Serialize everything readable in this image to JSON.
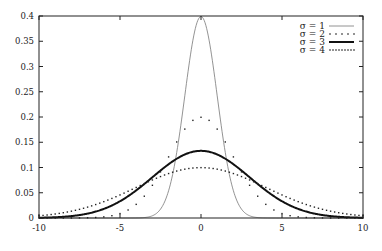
{
  "chart_data": {
    "type": "line",
    "title": "",
    "xlabel": "",
    "ylabel": "",
    "xlim": [
      -10,
      10
    ],
    "ylim": [
      0,
      0.4
    ],
    "x_ticks": [
      -10,
      -5,
      0,
      5,
      10
    ],
    "x_tick_labels": [
      "-10",
      "-5",
      "0",
      "5",
      "10"
    ],
    "y_ticks": [
      0,
      0.05,
      0.1,
      0.15,
      0.2,
      0.25,
      0.3,
      0.35,
      0.4
    ],
    "y_tick_labels": [
      "0",
      "0.05",
      "0.1",
      "0.15",
      "0.2",
      "0.25",
      "0.3",
      "0.35",
      "0.4"
    ],
    "grid": false,
    "legend_position": "top-right",
    "function": "Gaussian density N(0, sigma^2)",
    "series": [
      {
        "name": "σ = 1",
        "sigma": 1,
        "style": "solid-thin",
        "color": "#777777",
        "peak": 0.399
      },
      {
        "name": "σ = 2",
        "sigma": 2,
        "style": "sparse-dots",
        "color": "#222222",
        "peak": 0.199
      },
      {
        "name": "σ = 3",
        "sigma": 3,
        "style": "solid-thick",
        "color": "#111111",
        "peak": 0.133
      },
      {
        "name": "σ = 4",
        "sigma": 4,
        "style": "dense-dots",
        "color": "#222222",
        "peak": 0.0997
      }
    ]
  },
  "legend": {
    "items": [
      {
        "label": "σ = 1"
      },
      {
        "label": "σ = 2"
      },
      {
        "label": "σ = 3"
      },
      {
        "label": "σ = 4"
      }
    ]
  }
}
